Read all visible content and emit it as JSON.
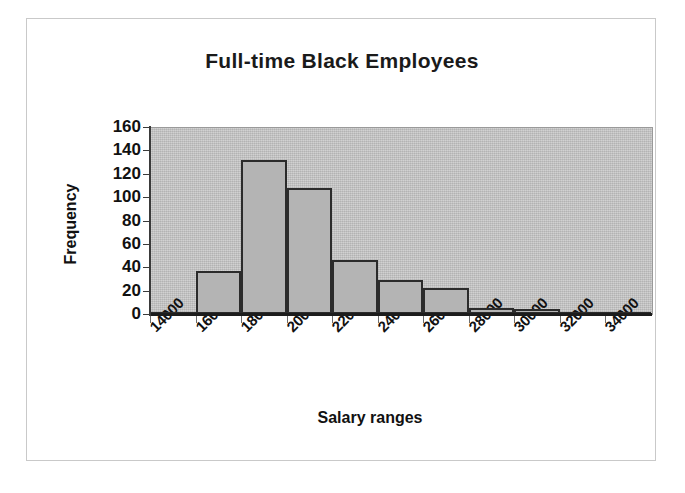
{
  "chart_data": {
    "type": "bar",
    "title": "Full-time Black Employees",
    "xlabel": "Salary ranges",
    "ylabel": "Frequency",
    "categories": [
      "14000",
      "16000",
      "18000",
      "20000",
      "22000",
      "24000",
      "26000",
      "28000",
      "30000",
      "32000",
      "34000"
    ],
    "values": [
      0,
      37,
      132,
      108,
      46,
      29,
      22,
      5,
      4,
      2,
      0
    ],
    "ylim": [
      0,
      160
    ],
    "yticks": [
      "0",
      "20",
      "40",
      "60",
      "80",
      "100",
      "120",
      "140",
      "160"
    ],
    "ytick_values": [
      0,
      20,
      40,
      60,
      80,
      100,
      120,
      140,
      160
    ],
    "grid": false,
    "legend": false,
    "legend_position": "none",
    "plot_background": "#c4c4c4",
    "bar_fill": "#b4b4b4",
    "bar_border": "#2b2b2b",
    "figure_background": "#ffffff",
    "frame_border": "#c9c9c9",
    "text_color": "#111111"
  }
}
